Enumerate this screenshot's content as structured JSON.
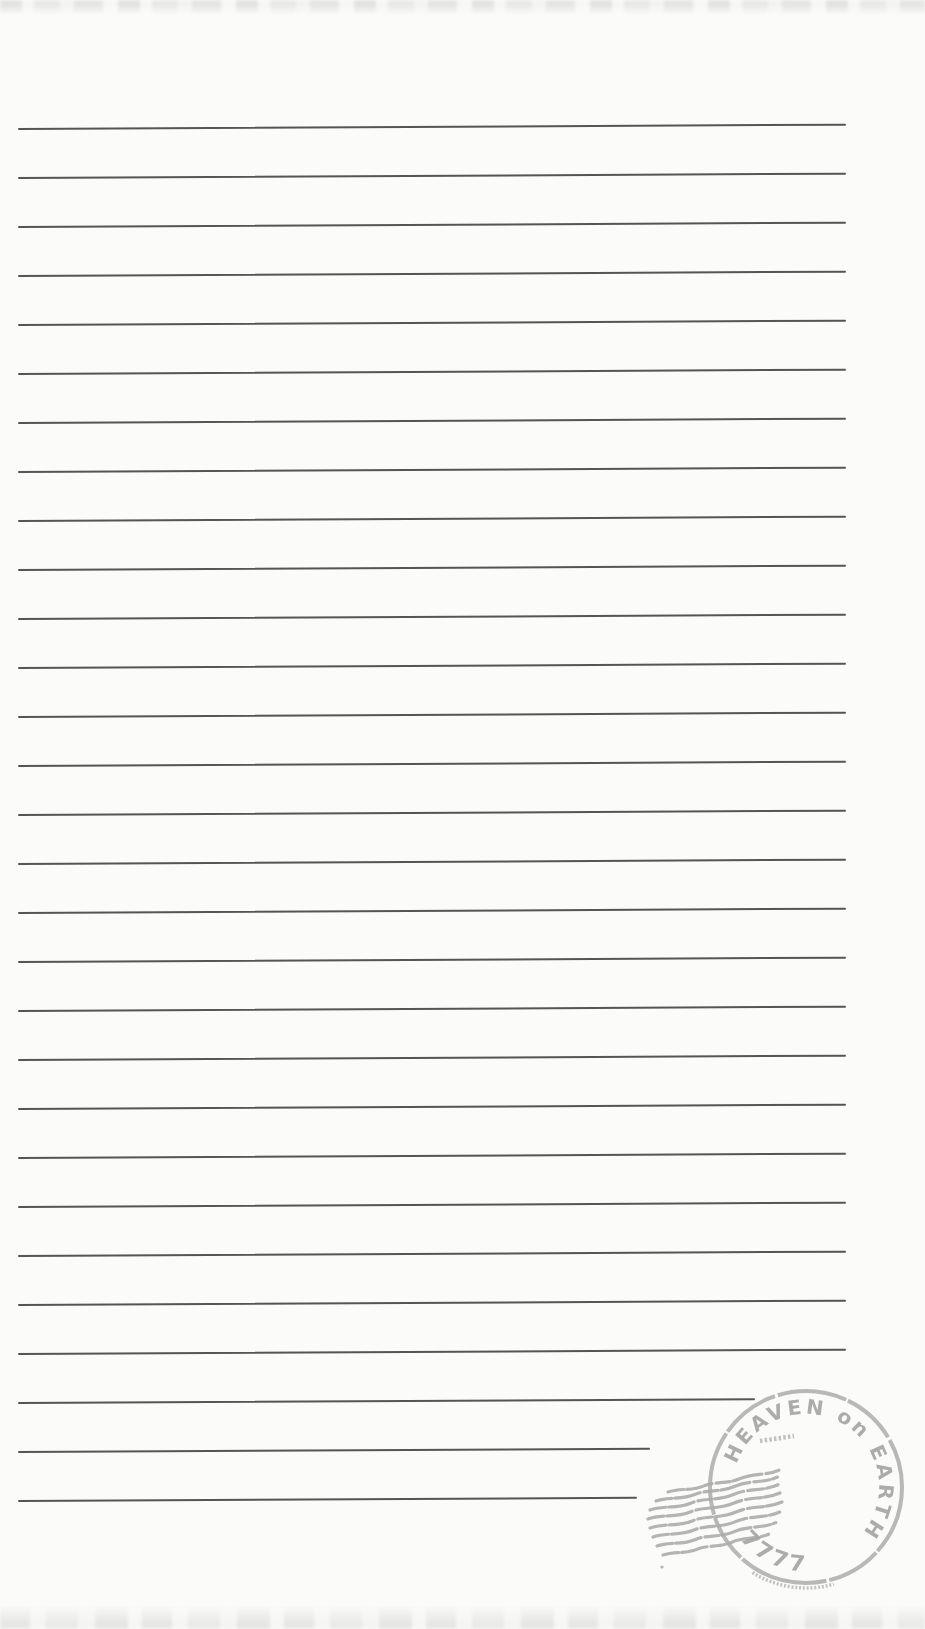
{
  "page": {
    "background_color": "#fbfbfa"
  },
  "ruled_lines": {
    "count": 29,
    "first_y": 128,
    "spacing": 49,
    "left_x": 18,
    "right_x": 846,
    "color": "#3e3e3e",
    "short_line_right_edges": [
      755,
      650,
      637
    ]
  },
  "stamp": {
    "arc_text": "HEAVEN on EARTH",
    "bottom_number": "7777",
    "ink_color": "#a9a9a9"
  }
}
